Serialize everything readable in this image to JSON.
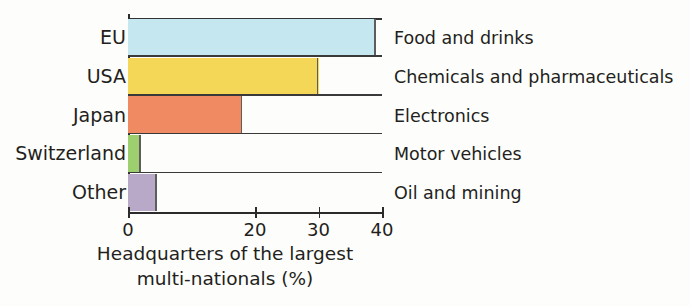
{
  "chart_data": {
    "type": "bar",
    "orientation": "horizontal",
    "title": "",
    "xlabel": "Headquarters of the largest multi-nationals (%)",
    "ylabel": "",
    "categories": [
      "EU",
      "USA",
      "Japan",
      "Switzerland",
      "Other"
    ],
    "values": [
      39,
      30,
      18,
      2,
      4.5
    ],
    "bar_colors": [
      "#c5e8f0",
      "#f5d758",
      "#ef8a62",
      "#9ecf6e",
      "#b8a9c9"
    ],
    "series_labels": [
      "Food and drinks",
      "Chemicals and pharmaceuticals",
      "Electronics",
      "Motor vehicles",
      "Oil and mining"
    ],
    "xlim": [
      0,
      40
    ],
    "xticks": [
      0,
      20,
      30,
      40
    ],
    "xtick_labels": [
      "0",
      "20",
      "30",
      "40"
    ],
    "grid": false,
    "legend": "right-of-plot-row-aligned"
  },
  "caption": {
    "line1": "Headquarters of the largest",
    "line2": "multi-nationals (%)"
  },
  "colors": {
    "axis": "#2b2b2b",
    "rule": "#3a3a3a",
    "text": "#231f20",
    "background": "#fdfdfb"
  }
}
